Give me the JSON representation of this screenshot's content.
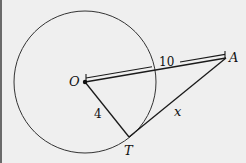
{
  "diagram": {
    "type": "circle-tangent",
    "circle": {
      "center": "O",
      "cx": 83,
      "cy": 82,
      "r": 71
    },
    "points": [
      {
        "name": "O",
        "x": 83,
        "y": 82
      },
      {
        "name": "A",
        "x": 224,
        "y": 58
      },
      {
        "name": "T",
        "x": 127,
        "y": 137
      }
    ],
    "segments": [
      {
        "from": "O",
        "to": "T",
        "label": "4"
      },
      {
        "from": "O",
        "to": "A",
        "label": "10"
      },
      {
        "from": "T",
        "to": "A",
        "label": "x"
      }
    ],
    "labels": {
      "O": "O",
      "A": "A",
      "T": "T",
      "OT": "4",
      "OA": "10",
      "TA": "x"
    },
    "colors": {
      "line": "#1a1a1a",
      "background": "#efefef"
    }
  }
}
